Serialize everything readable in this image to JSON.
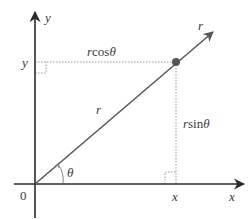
{
  "diagram": {
    "colors": {
      "axis": "#2b2b2b",
      "ray": "#555555",
      "guide": "#9a9a9a",
      "point": "#555555",
      "text": "#3a3a3a"
    },
    "origin": {
      "label": "0"
    },
    "axes": {
      "x_label": "x",
      "y_label": "y"
    },
    "point": {
      "x_tick_label": "x",
      "y_tick_label": "y"
    },
    "ray": {
      "label_tip": "r",
      "label_mid": "r"
    },
    "projections": {
      "horizontal_label_r": "r",
      "horizontal_label_fn": "cos",
      "horizontal_label_theta": "θ",
      "vertical_label_r": "r",
      "vertical_label_fn": "sin",
      "vertical_label_theta": "θ"
    },
    "angle": {
      "label": "θ"
    }
  }
}
